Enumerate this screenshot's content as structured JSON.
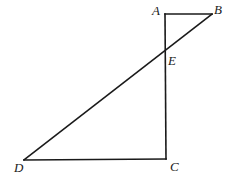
{
  "diagram": {
    "type": "geometry",
    "stroke_color": "#1a1a1a",
    "background": "#ffffff",
    "points": {
      "A": {
        "label": "A",
        "x": 165,
        "y": 14
      },
      "B": {
        "label": "B",
        "x": 212,
        "y": 14
      },
      "E": {
        "label": "E",
        "x": 165,
        "y": 50
      },
      "D": {
        "label": "D",
        "x": 24,
        "y": 160
      },
      "C": {
        "label": "C",
        "x": 166,
        "y": 159
      }
    },
    "segments": [
      {
        "from": "A",
        "to": "B"
      },
      {
        "from": "A",
        "to": "C"
      },
      {
        "from": "B",
        "to": "D"
      },
      {
        "from": "D",
        "to": "C"
      }
    ],
    "labels": [
      {
        "id": "A",
        "text": "A",
        "x": 152,
        "y": 15
      },
      {
        "id": "B",
        "text": "B",
        "x": 214,
        "y": 14
      },
      {
        "id": "E",
        "text": "E",
        "x": 168,
        "y": 65
      },
      {
        "id": "D",
        "text": "D",
        "x": 14,
        "y": 172
      },
      {
        "id": "C",
        "text": "C",
        "x": 170,
        "y": 171
      }
    ]
  }
}
